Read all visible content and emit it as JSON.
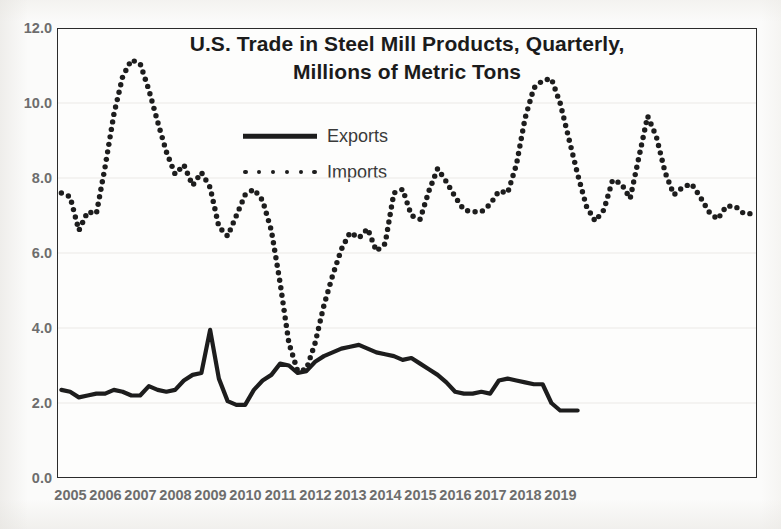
{
  "chart_data": {
    "type": "line",
    "title": "U.S. Trade in Steel Mill Products, Quarterly, Millions of Metric Tons",
    "title_line_1": "U.S. Trade in Steel Mill Products, Quarterly,",
    "title_line_2": "Millions of Metric Tons",
    "xlabel": "",
    "ylabel": "",
    "ylim": [
      0.0,
      12.0
    ],
    "ytick_labels": [
      "12.0",
      "10.0",
      "8.0",
      "6.0",
      "4.0",
      "2.0",
      "0.0"
    ],
    "ytick_values": [
      12.0,
      10.0,
      8.0,
      6.0,
      4.0,
      2.0,
      0.0
    ],
    "xtick_labels": [
      "2005",
      "2006",
      "2007",
      "2008",
      "2009",
      "2010",
      "2011",
      "2012",
      "2013",
      "2014",
      "2015",
      "2016",
      "2017",
      "2018",
      "2019"
    ],
    "grid": true,
    "legend_position": "upper-center",
    "x_unit": "quarter",
    "x_start": "2005 Q1",
    "x_end": "2019 Q4",
    "series": [
      {
        "name": "Exports",
        "style": "solid",
        "color": "#1d1d1d",
        "values": [
          2.35,
          2.3,
          2.15,
          2.2,
          2.25,
          2.25,
          2.35,
          2.3,
          2.2,
          2.2,
          2.45,
          2.35,
          2.3,
          2.35,
          2.6,
          2.75,
          2.8,
          3.95,
          2.65,
          2.05,
          1.95,
          1.95,
          2.35,
          2.6,
          2.75,
          3.05,
          3.0,
          2.8,
          2.85,
          3.1,
          3.25,
          3.35,
          3.45,
          3.5,
          3.55,
          3.45,
          3.35,
          3.3,
          3.25,
          3.15,
          3.2,
          3.05,
          2.9,
          2.75,
          2.55,
          2.3,
          2.25,
          2.25,
          2.3,
          2.25,
          2.6,
          2.65,
          2.6,
          2.55,
          2.5,
          2.5,
          2.0,
          1.8,
          1.8,
          1.8
        ]
      },
      {
        "name": "Imports",
        "style": "dotted",
        "color": "#1d1d1d",
        "values": [
          7.6,
          7.5,
          6.6,
          7.1,
          7.05,
          8.3,
          9.7,
          10.7,
          11.15,
          11.05,
          10.35,
          9.5,
          8.7,
          8.1,
          8.35,
          7.8,
          8.15,
          7.75,
          6.7,
          6.45,
          7.0,
          7.55,
          7.7,
          7.4,
          6.6,
          5.2,
          3.6,
          2.85,
          2.9,
          3.6,
          4.6,
          5.4,
          6.1,
          6.55,
          6.4,
          6.65,
          6.05,
          6.25,
          7.6,
          7.7,
          7.0,
          6.9,
          7.65,
          8.25,
          7.9,
          7.5,
          7.15,
          7.1,
          7.1,
          7.3,
          7.65,
          7.6,
          8.35,
          9.6,
          10.4,
          10.6,
          10.65,
          10.0,
          9.05,
          8.1,
          7.25,
          6.85,
          7.15,
          7.95,
          7.85,
          7.45,
          8.55,
          9.65,
          9.1,
          8.15,
          7.55,
          7.75,
          7.85,
          7.5,
          7.1,
          6.9,
          7.25,
          7.25,
          7.05,
          7.05
        ]
      }
    ]
  },
  "axes": {
    "plot_left_px": 57,
    "plot_top_px": 28,
    "plot_width_px": 700,
    "plot_height_px": 450
  }
}
